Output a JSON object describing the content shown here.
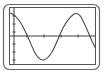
{
  "canvas": {
    "width": 105,
    "height": 76,
    "background_color": "#ffffff"
  },
  "bezel": {
    "name": "calculator-screen-bezel",
    "x": 3.5,
    "y": 4.5,
    "width": 96,
    "height": 65,
    "corner_radius": 6,
    "stroke_color": "#6b6b6b",
    "stroke_width": 1.2,
    "fill_color": "#ffffff"
  },
  "plot_frame": {
    "name": "plot-area-frame",
    "x": 9.5,
    "y": 7.5,
    "width": 86,
    "height": 57,
    "stroke_color": "#555555",
    "stroke_width": 1,
    "fill_color": "#ffffff"
  },
  "chart_data": {
    "type": "line",
    "title": "",
    "subtitle": "",
    "xlabel": "",
    "ylabel": "",
    "grid": false,
    "legend": null,
    "legend_position": "none",
    "curve_label": "sine wave",
    "curve_color": "#4a4a4a",
    "curve_width": 1.1,
    "xlim": [
      0,
      105
    ],
    "ylim": [
      76,
      0
    ],
    "axis_color": "#3d3d3d",
    "axis_width": 1,
    "x_axis": {
      "name": "x-axis",
      "y_pixel": 36,
      "x_start": 10,
      "x_end": 95,
      "tick_pixels": [
        27,
        44,
        61,
        78
      ],
      "tick_half_length": 1.6
    },
    "y_axis": {
      "name": "y-axis",
      "x_pixel": 14,
      "y_start": 8,
      "y_end": 64,
      "tick_pixels": [
        16,
        24,
        32,
        44,
        52,
        60
      ],
      "tick_half_length": 1.6
    },
    "x": [
      10,
      14,
      18,
      22,
      26,
      30,
      34,
      38,
      42,
      46,
      50,
      54,
      58,
      62,
      66,
      70,
      74,
      78,
      82,
      86,
      90,
      94,
      98
    ],
    "y": [
      13,
      15,
      19,
      25,
      33,
      42,
      51,
      57,
      60,
      60,
      57,
      51,
      43,
      34,
      26,
      19,
      15,
      14,
      16,
      22,
      30,
      40,
      50
    ],
    "path_d": "M 10 13 C 14 14 18 18 22 25 C 26 32 30 42 34 51 C 37 57 40 60 43 60 C 46 60 49 57 52 52 C 56 45 59 36 63 28 C 66 22 70 17 74 14 C 76 13 79 14 81 17 C 84 22 88 32 92 41 C 95 47 97 51 99 55"
  }
}
